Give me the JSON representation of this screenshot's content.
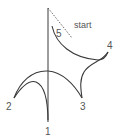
{
  "diagram": {
    "labels": {
      "start": "start",
      "p1": "1",
      "p2": "2",
      "p3": "3",
      "p4": "4",
      "p5": "5"
    },
    "colors": {
      "stroke": "#3a3a3a",
      "text": "#555555",
      "dotted": "#555555"
    }
  }
}
